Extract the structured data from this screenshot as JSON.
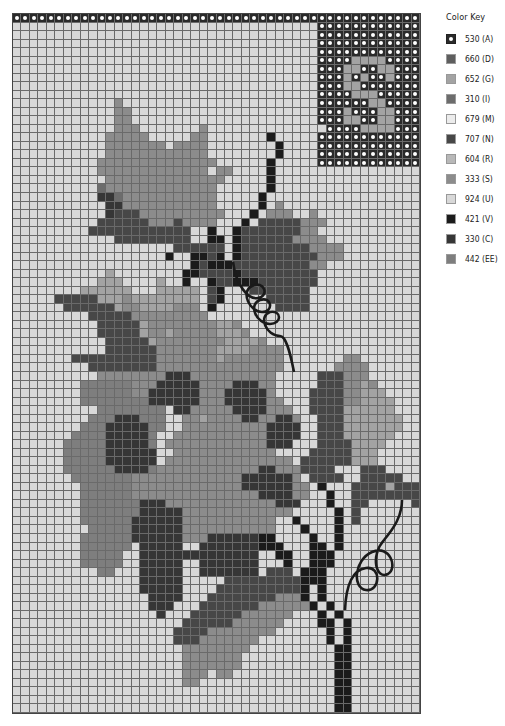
{
  "key": {
    "title": "Color Key",
    "items": [
      {
        "code": "A",
        "label": "530 (A)",
        "color": "#2a2a2a",
        "style": "dot"
      },
      {
        "code": "D",
        "label": "660 (D)",
        "color": "#5e5e5e"
      },
      {
        "code": "G",
        "label": "652 (G)",
        "color": "#a3a3a3"
      },
      {
        "code": "I",
        "label": "310 (I)",
        "color": "#6c6c6c"
      },
      {
        "code": "M",
        "label": "679 (M)",
        "color": "#ececec"
      },
      {
        "code": "N",
        "label": "707 (N)",
        "color": "#474747"
      },
      {
        "code": "R",
        "label": "604 (R)",
        "color": "#b8b8b8"
      },
      {
        "code": "S",
        "label": "333 (S)",
        "color": "#8c8c8c"
      },
      {
        "code": "U",
        "label": "924 (U)",
        "color": "#d8d8d8"
      },
      {
        "code": "V",
        "label": "421 (V)",
        "color": "#1b1b1b"
      },
      {
        "code": "C",
        "label": "330 (C)",
        "color": "#363636"
      },
      {
        "code": "E",
        "label": "442 (EE)",
        "color": "#7e7e7e"
      }
    ]
  },
  "pattern": {
    "columns": 48,
    "rows": 82,
    "background_code": "U",
    "monogram_letter": "S",
    "grid": [
      "AAAAAAAAAAAAAAAAAAAAAAAAAAAAAAAAAAAAAAAAAAAAAAAA",
      "....................................AAAAAAAAAAAA",
      "....................................AAAAAAAAAAAA",
      "....................................AAAAAAAAAAAA",
      "....................................AAAAAAAAAAAA",
      "....................................AAAAGGGGAAAA",
      "....................................AAAGGAAGGAAA",
      "....................................AAAGAGAAGAAA",
      "....................................AAAGGAAAAAAA",
      "....................................AAAAGGGAAAAA",
      "............S.......................AAAAAAGGAAAA",
      "............SS......................AAAGAAAGGAAA",
      "............SS......................AAAGGAAGGAAA",
      "............SSS.......S..............AAAAGGGGAAAA",
      "...........SSSSS.....SS.......V.....AAAAAAAAAAAA",
      "...........SSSSSSS.SSSS........V....AAAAAAAAAAAA",
      "...........SSSSSSSSSSSS........V....AAAAAAAAAAAA",
      "..........SSSSSSSSSSSSSS......V.....AAAAAAAAAAAA",
      "..........SSSSSSSSSSSSS.SS....V.................",
      "...........SSSSSSSSSSSSSS.....V.................",
      "..........ISSSSSSSSSSSSS......V.................",
      "..........CCISSSSSSSSSSS.....V..................",
      "...........CCSSSSSSSSSSS.....V.S.......",
      "...........CNNNSSSSSSSSSS...V.SSS..S............",
      "..........NNNNNNSSSNSSSS...V.NNNNNSSS...........",
      ".........NNNNNNNNNNNN..V..VNNNNNNNSS............",
      "............NNNNNNNNN..VV.VNNNNNNSSSS...........",
      "...................NNNNNN.VNNNNNNNNSSSS.........",
      "..................V..VVNV.VNNNNNNNNNSSS.........",
      ".....................VNVVVNNNNNNNNNSS...........",
      "...........G........VVNNNNVNNNNNNNNN............",
      "..........GGG....G..V..VNNVVVNNNNNNN............",
      "........GGGGGG...GGGGG.NV...NNNNNNN.............",
      ".....NNNNNGGGSGGGGGGGG.NV.....NNNNN.............",
      "......NNNNNNGSSGGGGSSS.V.......NNNN.............",
      ".........NNNNNSSSSSSSSS........................",
      "..........NNNNNGSSSSSSSSGGS....................",
      "..........NNNNNGSSGSSSSSGGGS...................",
      "...........NNNNNGSSSSSSSSGGGGS.................",
      "...........NNNNNNSSSSSSSGGGGSSSS...............",
      ".......NNNNNNNNNNSSSSSSSGSSSSSSS.......SS.......",
      ".........NNNNNNNNSSSSSSSSSSSSSSS......SSSS......",
      "..........SSSSSSSSCCCSSSSSSSSSS.....NNNSSS......",
      "........EEEEEESSSCCCCCSSSSCCCSS.....NNNSSGS.....",
      "........EEEEEESSCCCCCCSSSCCCCCS....NNNNSSGGG....",
      "........EEEEEEEECCCCCCSSSCCCCCSS...NNNNSSGGGG...",
      "..........EEEEEEEE.CCSSSSSCCCCSSS..NNNNGGGGGG...",
      ".........EEECCCEEE..SSGSSSSCCSSCCS..NNNGGGGGGG..",
      "........EEECCCCCEE..SSSSSSSSSSCCCC..NNNGGGGGGG..",
      ".......EEEECCCCCE..SSSSSSSSSSSCCCC..NNNGGGGGG...",
      "......EEEEECCCCCE.SSSSSSSSSSSSCCC...NNNNGGGG....",
      "......EEEEECCCCCC..SSSSSSSSSSSS....NNNNNGGG.....",
      "......EEEEECCCCCC.SSSSSSSSSSSSSSS.NNNNNNGGG.....",
      "......EEEEEECCCCESSSSSSSSSSSSCCSSSNNNN...NNN.....",
      ".......EEEEEEESSSSSSSSSSSSSCCCCCCS.NNNN..NNNNN...",
      "........EEEEEESSSSSSSSSSSSSCCCCCCSS.V...NNNNGNNN.",
      "........EEEEEESSSSSSSSSSSSSSSCCCCSS..V..NNNNNNNN.",
      "........EEEEEEECCCSSSSSSSSSSSSSCCC...V..NN.....N.",
      "........EEEEEEECCCCCSSSSSSSSSSSSS.....V.N........",
      "........EEEEEECCCCCCSSSSSSSSSSS..V....V.N........",
      ".........EEEEECCCCCCSSSSSSSSSSS...V...V..........",
      "........EEEEEECCCCCCSSSCCCCCCVV....V..V..........",
      "........EEEEEE.CCCCC..CCCCCCCVVV...VV.V..........",
      "........EEEEE..CCCCCCCCCCCCCC..VV..VVV...........",
      "........EEEEE..CCCCC..CCCCCCC...V..VVV...........",
      "..........EE...CCCCC..CCCCCCC.NNN.VVV............",
      "...............CCCCC.....NNNNNNNNNVVV...........",
      "...............CCCCC....NNNNNNNNNNV.V...........",
      "................CCCC...NNNNNNNNSSSV.V...........",
      "................CCC...NNNNNNNSSSSSSV.V..........",
      ".................C...NNNNNNSSSSSS...V.V..........",
      "....................NNNNNNSSSSSS....VV.V.........",
      "...................NNNNSSSSSSSS......V.V.........",
      "...................NNNSSSSSSS........V.V.........",
      "....................SSSSSSSS..........VV.........",
      "....................SSSSSSS...........VV.........",
      "....................SSSSSSS...........VV.........",
      "....................SSS.SS............VV.........",
      "....................SS................VV.........",
      "......................................VV.........",
      "......................................VV.........",
      "......................................VV........."
    ]
  }
}
